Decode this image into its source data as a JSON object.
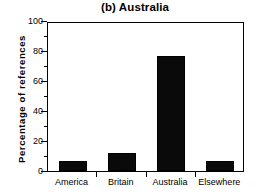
{
  "chart_data": {
    "type": "bar",
    "title": "(b) Australia",
    "xlabel": "",
    "ylabel": "Percentage  of  references",
    "categories": [
      "America",
      "Britain",
      "Australia",
      "Elsewhere"
    ],
    "values": [
      7,
      12,
      77,
      6.5
    ],
    "ylim": [
      0,
      100
    ],
    "ytick_labels": [
      "0",
      "20",
      "40",
      "60",
      "80",
      "100"
    ],
    "ytick_values": [
      0,
      20,
      40,
      60,
      80,
      100
    ],
    "yminor_values": [
      10,
      30,
      50,
      70,
      90
    ],
    "grid": false,
    "legend": false,
    "bar_color": "#0a0a0a",
    "frame_color": "#000000",
    "background": "#ffffff"
  }
}
